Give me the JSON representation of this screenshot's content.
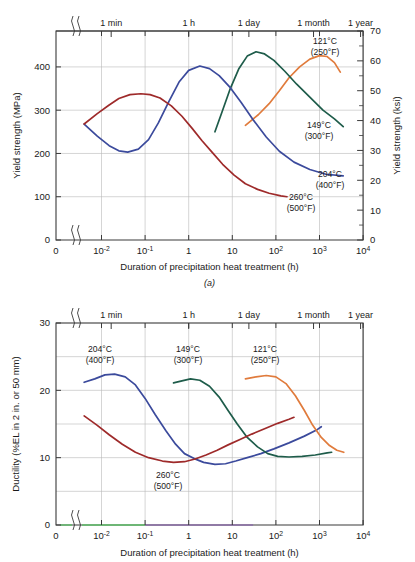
{
  "figure": {
    "panel_a_label": "(a)",
    "x_axis_title": "Duration of precipitation heat treatment (h)",
    "x_tick_labels": [
      "0",
      "10⁻²",
      "10⁻¹",
      "1",
      "10",
      "10²",
      "10³",
      "10⁴"
    ],
    "top_axis_labels": [
      "1 min",
      "1 h",
      "1 day",
      "1 month",
      "1 year"
    ]
  },
  "chart_data": [
    {
      "type": "line",
      "id": "yield-strength",
      "title": "",
      "panel": "(a)",
      "xlabel": "Duration of precipitation heat treatment (h)",
      "ylabel": "Yield strength (MPa)",
      "ylabel_secondary": "Yield strength (ksi)",
      "xscale": "log",
      "xlim": [
        0.004,
        10000
      ],
      "xticks": [
        0.01,
        0.1,
        1,
        10,
        100,
        1000,
        10000
      ],
      "xticklabels": [
        "10⁻²",
        "10⁻¹",
        "1",
        "10",
        "10²",
        "10³",
        "10⁴"
      ],
      "x_origin_label": "0",
      "axis_break": true,
      "ylim": [
        0,
        483
      ],
      "yticks": [
        0,
        100,
        200,
        300,
        400
      ],
      "ylim_secondary": [
        0,
        70
      ],
      "yticks_secondary": [
        0,
        10,
        20,
        30,
        40,
        50,
        60,
        70
      ],
      "ytick_minor_secondary": [
        5,
        15,
        25,
        35,
        45,
        55,
        65
      ],
      "grid": true,
      "top_axis": {
        "labels": [
          "1 min",
          "1 h",
          "1 day",
          "1 month",
          "1 year"
        ],
        "values": [
          0.01667,
          1,
          24,
          730,
          8760
        ]
      },
      "series": [
        {
          "name": "121°C (250°F)",
          "label_line1": "121°C",
          "label_line2": "(250°F)",
          "color": "#e07b3c",
          "points": [
            [
              20,
              265
            ],
            [
              40,
              290
            ],
            [
              70,
              315
            ],
            [
              120,
              345
            ],
            [
              200,
              375
            ],
            [
              350,
              400
            ],
            [
              600,
              418
            ],
            [
              1000,
              426
            ],
            [
              1500,
              424
            ],
            [
              2200,
              410
            ],
            [
              3000,
              388
            ]
          ]
        },
        {
          "name": "149°C (300°F)",
          "label_line1": "149°C",
          "label_line2": "(300°F)",
          "color": "#1e5c4a",
          "points": [
            [
              4,
              250
            ],
            [
              6,
              300
            ],
            [
              9,
              350
            ],
            [
              14,
              395
            ],
            [
              22,
              425
            ],
            [
              35,
              435
            ],
            [
              55,
              430
            ],
            [
              90,
              415
            ],
            [
              160,
              390
            ],
            [
              300,
              360
            ],
            [
              600,
              330
            ],
            [
              1200,
              300
            ],
            [
              2200,
              280
            ],
            [
              3500,
              262
            ]
          ]
        },
        {
          "name": "204°C (400°F)",
          "label_line1": "204°C",
          "label_line2": "(400°F)",
          "color": "#3b4a9c",
          "points": [
            [
              0.004,
              268
            ],
            [
              0.008,
              240
            ],
            [
              0.015,
              218
            ],
            [
              0.025,
              206
            ],
            [
              0.04,
              203
            ],
            [
              0.07,
              210
            ],
            [
              0.12,
              232
            ],
            [
              0.2,
              270
            ],
            [
              0.35,
              320
            ],
            [
              0.6,
              365
            ],
            [
              1,
              392
            ],
            [
              1.8,
              402
            ],
            [
              3,
              396
            ],
            [
              5,
              380
            ],
            [
              9,
              352
            ],
            [
              16,
              318
            ],
            [
              30,
              278
            ],
            [
              60,
              238
            ],
            [
              120,
              205
            ],
            [
              260,
              180
            ],
            [
              600,
              163
            ],
            [
              1400,
              152
            ],
            [
              3500,
              148
            ]
          ]
        },
        {
          "name": "260°C (500°F)",
          "label_line1": "260°C",
          "label_line2": "(500°F)",
          "color": "#9e2a2a",
          "points": [
            [
              0.004,
              268
            ],
            [
              0.008,
              292
            ],
            [
              0.015,
              312
            ],
            [
              0.025,
              327
            ],
            [
              0.045,
              336
            ],
            [
              0.08,
              338
            ],
            [
              0.13,
              336
            ],
            [
              0.22,
              328
            ],
            [
              0.4,
              310
            ],
            [
              0.7,
              286
            ],
            [
              1.2,
              258
            ],
            [
              2,
              230
            ],
            [
              3.5,
              202
            ],
            [
              6,
              175
            ],
            [
              11,
              150
            ],
            [
              20,
              130
            ],
            [
              38,
              117
            ],
            [
              70,
              108
            ],
            [
              130,
              102
            ],
            [
              180,
              100
            ]
          ]
        }
      ]
    },
    {
      "type": "line",
      "id": "ductility",
      "title": "",
      "panel": "(b)",
      "xlabel": "Duration of precipitation heat treatment (h)",
      "ylabel": "Ductility (%EL in 2 in. or 50 mm)",
      "xscale": "log",
      "xlim": [
        0.004,
        10000
      ],
      "xticks": [
        0.01,
        0.1,
        1,
        10,
        100,
        1000,
        10000
      ],
      "xticklabels": [
        "10⁻²",
        "10⁻¹",
        "1",
        "10",
        "10²",
        "10³",
        "10⁴"
      ],
      "x_origin_label": "0",
      "axis_break": true,
      "ylim": [
        0,
        30
      ],
      "yticks": [
        0,
        10,
        20,
        30
      ],
      "ytick_minor": [
        5,
        15,
        25
      ],
      "grid": true,
      "top_axis": {
        "labels": [
          "1 min",
          "1 h",
          "1 day",
          "1 month",
          "1 year"
        ],
        "values": [
          0.01667,
          1,
          24,
          730,
          8760
        ]
      },
      "series": [
        {
          "name": "204°C (400°F)",
          "label_line1": "204°C",
          "label_line2": "(400°F)",
          "color": "#3b4a9c",
          "points": [
            [
              0.004,
              21.2
            ],
            [
              0.007,
              21.7
            ],
            [
              0.012,
              22.3
            ],
            [
              0.02,
              22.4
            ],
            [
              0.035,
              22.0
            ],
            [
              0.06,
              20.8
            ],
            [
              0.1,
              18.8
            ],
            [
              0.17,
              16.4
            ],
            [
              0.3,
              14.0
            ],
            [
              0.5,
              12.0
            ],
            [
              0.8,
              10.6
            ],
            [
              1.3,
              9.9
            ],
            [
              2.2,
              9.3
            ],
            [
              4,
              9.0
            ],
            [
              7,
              9.1
            ],
            [
              12,
              9.5
            ],
            [
              22,
              10.0
            ],
            [
              45,
              10.6
            ],
            [
              90,
              11.3
            ],
            [
              200,
              12.2
            ],
            [
              450,
              13.2
            ],
            [
              900,
              14.2
            ],
            [
              1100,
              14.6
            ]
          ]
        },
        {
          "name": "149°C (300°F)",
          "label_line1": "149°C",
          "label_line2": "(300°F)",
          "color": "#1e5c4a",
          "points": [
            [
              0.45,
              21.1
            ],
            [
              0.7,
              21.4
            ],
            [
              1.1,
              21.7
            ],
            [
              1.8,
              21.5
            ],
            [
              3,
              20.6
            ],
            [
              5,
              19.0
            ],
            [
              8,
              17.0
            ],
            [
              13,
              15.0
            ],
            [
              22,
              13.0
            ],
            [
              38,
              11.6
            ],
            [
              65,
              10.6
            ],
            [
              110,
              10.2
            ],
            [
              200,
              10.1
            ],
            [
              400,
              10.2
            ],
            [
              800,
              10.4
            ],
            [
              1500,
              10.7
            ],
            [
              1900,
              10.8
            ]
          ]
        },
        {
          "name": "121°C (250°F)",
          "label_line1": "121°C",
          "label_line2": "(250°F)",
          "color": "#e07b3c",
          "points": [
            [
              20,
              21.7
            ],
            [
              35,
              22.0
            ],
            [
              60,
              22.2
            ],
            [
              100,
              22.0
            ],
            [
              170,
              21.0
            ],
            [
              280,
              19.2
            ],
            [
              450,
              17.0
            ],
            [
              700,
              14.8
            ],
            [
              1100,
              13.0
            ],
            [
              1700,
              11.8
            ],
            [
              2500,
              11.1
            ],
            [
              3600,
              10.8
            ]
          ]
        },
        {
          "name": "260°C (500°F)",
          "label_line1": "260°C",
          "label_line2": "(500°F)",
          "color": "#9e2a2a",
          "points": [
            [
              0.004,
              16.2
            ],
            [
              0.008,
              14.8
            ],
            [
              0.015,
              13.4
            ],
            [
              0.03,
              12.0
            ],
            [
              0.06,
              10.8
            ],
            [
              0.12,
              10.0
            ],
            [
              0.25,
              9.5
            ],
            [
              0.45,
              9.3
            ],
            [
              0.8,
              9.4
            ],
            [
              1.4,
              9.8
            ],
            [
              2.5,
              10.4
            ],
            [
              4.5,
              11.1
            ],
            [
              8,
              11.9
            ],
            [
              15,
              12.7
            ],
            [
              28,
              13.5
            ],
            [
              55,
              14.3
            ],
            [
              110,
              15.1
            ],
            [
              200,
              15.7
            ],
            [
              260,
              16.0
            ]
          ]
        }
      ]
    }
  ]
}
